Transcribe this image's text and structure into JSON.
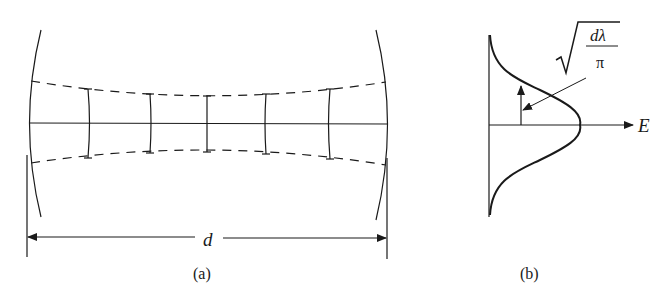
{
  "figure_a": {
    "caption": "(a)",
    "distance_label": "d",
    "wavefront_count": 5,
    "description": "Optical resonator with two curved mirrors; dashed Gaussian beam envelope and curved wavefronts"
  },
  "figure_b": {
    "caption": "(b)",
    "axis_label": "E",
    "width_label_numerator": "dλ",
    "width_label_denominator": "π",
    "description": "Gaussian transverse field profile E with beam-width marker"
  },
  "colors": {
    "ink": "#1a1a1a",
    "background": "#ffffff"
  }
}
